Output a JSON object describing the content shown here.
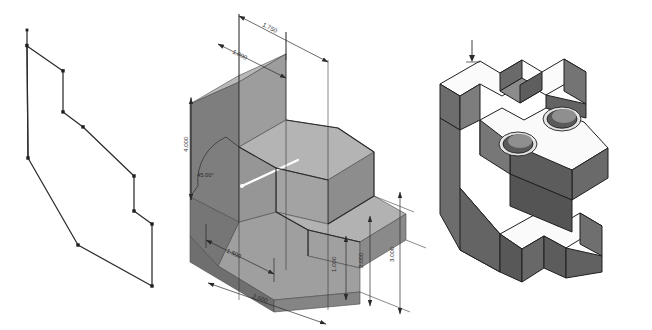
{
  "document": {
    "title": "Isometric Part Views",
    "background_color": "#ffffff",
    "view_count": 3
  },
  "palette": {
    "line": "#2b2b2b",
    "dimension_line": "#2b2b2b",
    "text": "#2b2b2b",
    "face_top_light": "#b7b7b7",
    "face_front_mid": "#9a9a9a",
    "face_side_dark": "#7c7c7c",
    "face_shadow": "#6d6d6d",
    "solid_top_white": "#fbfbfb",
    "solid_face_gray": "#6e6e6e",
    "solid_face_dark": "#5c5c5c",
    "solid_edge": "#1f1f1f",
    "hole_bore": "#555555",
    "highlight": "#ffffff"
  },
  "views": [
    {
      "id": "wireframe-view",
      "name": "wireframe-profile-view",
      "label": "Wireframe edge profile",
      "style": "wireframe",
      "vertex_count": 12
    },
    {
      "id": "dimensioned-view",
      "name": "dimensioned-isometric-view",
      "label": "Shaded isometric with dimensions",
      "style": "shaded-with-dimensions"
    },
    {
      "id": "solid-view",
      "name": "solid-isometric-view",
      "label": "Solid shaded isometric",
      "style": "shaded-solid",
      "hole_count": 2
    }
  ],
  "dimensions": [
    {
      "id": "dim-1750",
      "name": "dimension-1750",
      "value": "1.750",
      "orientation": "top-oblique"
    },
    {
      "id": "dim-1000-top",
      "name": "dimension-1000-top",
      "value": "1.000",
      "orientation": "top-oblique"
    },
    {
      "id": "dim-4000",
      "name": "dimension-4000-height",
      "value": "4.000",
      "orientation": "vertical-left"
    },
    {
      "id": "dim-angle",
      "name": "dimension-angle-45",
      "value": "45.00°",
      "orientation": "angular"
    },
    {
      "id": "dim-1500",
      "name": "dimension-1500",
      "value": "1.500",
      "orientation": "bottom-oblique"
    },
    {
      "id": "dim-2500",
      "name": "dimension-2500-depth",
      "value": "2.500",
      "orientation": "bottom-oblique"
    },
    {
      "id": "dim-1000-right",
      "name": "dimension-1000-right",
      "value": "1.000",
      "orientation": "vertical-right"
    },
    {
      "id": "dim-2000",
      "name": "dimension-2000-right",
      "value": "2.000",
      "orientation": "vertical-right"
    },
    {
      "id": "dim-3000",
      "name": "dimension-3000-right",
      "value": "3.000",
      "orientation": "vertical-right"
    }
  ],
  "annotations": [
    {
      "id": "leader-mark",
      "name": "leader-tick-mark",
      "value": "",
      "view": "solid-view"
    }
  ]
}
